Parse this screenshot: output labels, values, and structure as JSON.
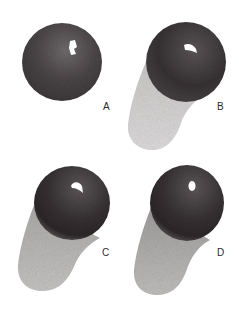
{
  "figure": {
    "panels": [
      {
        "id": "A",
        "label": "A",
        "has_shadow": false
      },
      {
        "id": "B",
        "label": "B",
        "has_shadow": true
      },
      {
        "id": "C",
        "label": "C",
        "has_shadow": true
      },
      {
        "id": "D",
        "label": "D",
        "has_shadow": true
      }
    ]
  },
  "colors": {
    "background": "#ffffff",
    "sphere_dark": "#2e2a2c",
    "sphere_mid": "#5a5558",
    "shadow_light": "#d4d2d2",
    "shadow_mid": "#bcb9b9",
    "highlight": "#ffffff",
    "label": "#2a2a2a"
  }
}
